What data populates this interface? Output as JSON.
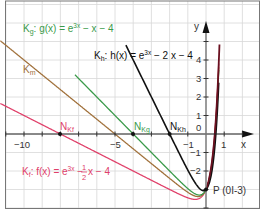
{
  "chart_data": {
    "type": "line",
    "title": "",
    "xlabel": "x",
    "ylabel": "y",
    "xlim": [
      -11.3,
      3.1
    ],
    "ylim": [
      -4.0,
      7.2
    ],
    "grid": true,
    "x_ticks": [
      -10,
      -5,
      -1,
      1
    ],
    "x_tick_labels": [
      "−10",
      "−5",
      "−1",
      "1"
    ],
    "y_ticks": [
      4,
      3,
      2,
      1,
      -1,
      -2
    ],
    "y_tick_labels": [
      "4",
      "3",
      "2",
      "1",
      "−1",
      "−2"
    ],
    "origin_label": "0",
    "series": [
      {
        "name": "Kf",
        "label": "K_f: f(x) = e^{3x} − 1/2 x − 4",
        "slope": -0.5,
        "color": "#e0406a"
      },
      {
        "name": "Km",
        "label": "K_m",
        "slope": -0.8,
        "color": "#a0703a"
      },
      {
        "name": "Kg",
        "label": "K_g: g(x) = e^{3x} − x − 4",
        "slope": -1,
        "color": "#3a9a4a"
      },
      {
        "name": "Kh",
        "label": "K_h: h(x) = e^{3x} − 2x − 4",
        "slope": -2,
        "color": "#111111"
      }
    ],
    "points": [
      {
        "name": "N_Kf",
        "x": -8,
        "y": 0
      },
      {
        "name": "N_Kg",
        "x": -4,
        "y": 0
      },
      {
        "name": "N_Kh",
        "x": -2,
        "y": 0
      },
      {
        "name": "P",
        "x": 0,
        "y": -3,
        "label": "P (0I-3)"
      }
    ]
  },
  "labels": {
    "kg_name": "K",
    "kg_sub": "g",
    "kg_eq": ": g(x) = e",
    "kg_exp": "3x",
    "kg_tail": " − x − 4",
    "km_name": "K",
    "km_sub": "m",
    "kh_name": "K",
    "kh_sub": "h",
    "kh_eq": ": h(x) = e",
    "kh_exp": "3x",
    "kh_tail": " − 2 x − 4",
    "kf_name": "K",
    "kf_sub": "f",
    "kf_eq": ": f(x) = e",
    "kf_exp": "3x",
    "kf_tail1": " − ",
    "kf_frac_num": "1",
    "kf_frac_den": "2",
    "kf_tail2": " x − 4",
    "nkf": "N",
    "nkf_sub": "Kf",
    "nkg": "N",
    "nkg_sub": "Kg",
    "nkh": "N",
    "nkh_sub": "Kh",
    "p_label": "P (0I-3)",
    "x_axis": "x",
    "y_axis": "y",
    "origin": "0",
    "xt_m10": "−10",
    "xt_m5": "−5",
    "xt_m1": "−1",
    "xt_1": "1",
    "yt_4": "4",
    "yt_3": "3",
    "yt_2": "2",
    "yt_1": "1",
    "yt_m1": "−1",
    "yt_m2": "−2"
  }
}
